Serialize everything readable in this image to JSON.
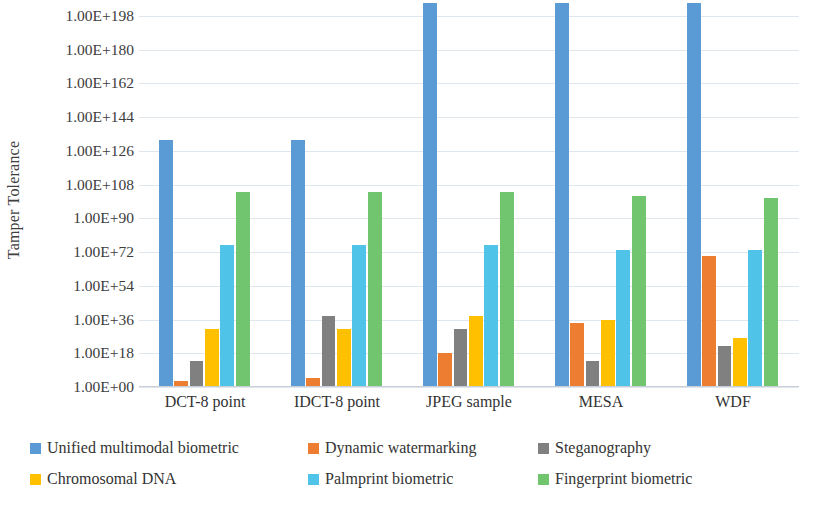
{
  "chart_data": {
    "type": "bar",
    "title": "",
    "subtitle": "",
    "xlabel": "",
    "ylabel": "Tamper Tolerance",
    "y_scale": "log",
    "grid": true,
    "legend_position": "bottom",
    "ylim": [
      1,
      1e+198
    ],
    "y_tick_labels": [
      "1.00E+198",
      "1.00E+180",
      "1.00E+162",
      "1.00E+144",
      "1.00E+126",
      "1.00E+108",
      "1.00E+90",
      "1.00E+72",
      "1.00E+54",
      "1.00E+36",
      "1.00E+18",
      "1.00E+00"
    ],
    "y_tick_exponents": [
      198,
      180,
      162,
      144,
      126,
      108,
      90,
      72,
      54,
      36,
      18,
      0
    ],
    "categories": [
      "DCT-8 point",
      "IDCT-8 point",
      "JPEG sample",
      "MESA",
      "WDF"
    ],
    "series": [
      {
        "name": "Unified multimodal biometric",
        "color": "#5b9bd5",
        "exponents": [
          132,
          132,
          205,
          205,
          205
        ],
        "values": [
          1e+132,
          1e+132,
          1e+205,
          1e+205,
          1e+205
        ]
      },
      {
        "name": "Dynamic watermarking",
        "color": "#ed7d31",
        "exponents": [
          3,
          5,
          18,
          34,
          70
        ],
        "values": [
          1000.0,
          100000.0,
          1e+18,
          1e+34,
          1e+70
        ]
      },
      {
        "name": "Steganography",
        "color": "#808080",
        "exponents": [
          14,
          38,
          31,
          14,
          22
        ],
        "values": [
          100000000000000.0,
          1e+38,
          1e+31,
          100000000000000.0,
          1e+22
        ]
      },
      {
        "name": "Chromosomal DNA",
        "color": "#ffc000",
        "exponents": [
          31,
          31,
          38,
          36,
          26
        ],
        "values": [
          1e+31,
          1e+31,
          1e+38,
          1e+36,
          1e+26
        ]
      },
      {
        "name": "Palmprint biometric",
        "color": "#4fc3e8",
        "exponents": [
          76,
          76,
          76,
          73,
          73
        ],
        "values": [
          1e+76,
          1e+76,
          1e+76,
          1e+73,
          1e+73
        ]
      },
      {
        "name": "Fingerprint biometric",
        "color": "#70c56e",
        "exponents": [
          104,
          104,
          104,
          102,
          101
        ],
        "values": [
          1e+104,
          1e+104,
          1e+104,
          1e+102,
          1e+101
        ]
      }
    ]
  }
}
